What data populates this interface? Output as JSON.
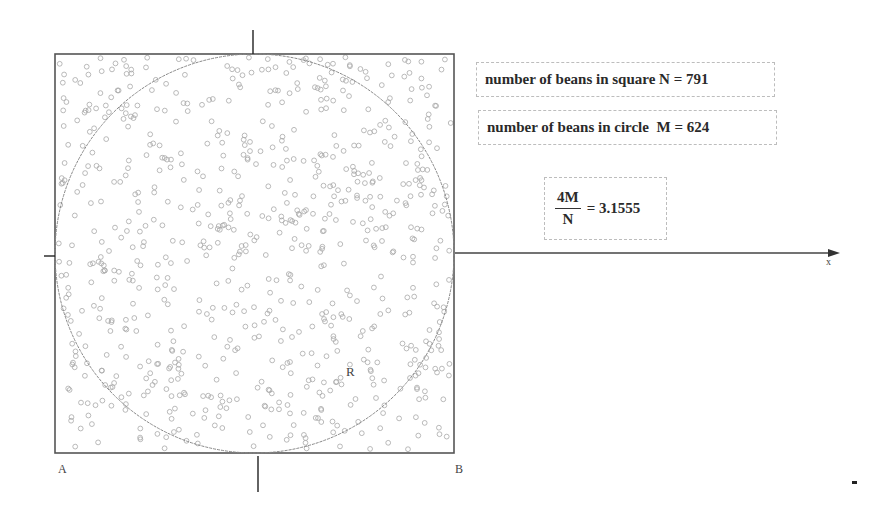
{
  "diagram": {
    "square": {
      "x": 55,
      "y": 54,
      "size": 399,
      "stroke": "#555555"
    },
    "circle": {
      "cx": 254.5,
      "cy": 253.5,
      "r": 199.5,
      "stroke": "#888888"
    },
    "axes": {
      "x_axis": {
        "from": [
          455,
          253
        ],
        "to": [
          840,
          253
        ],
        "label": "x"
      },
      "top_tick": {
        "x": 253,
        "y1": 30,
        "y2": 54
      },
      "bottom_tick": {
        "x": 258,
        "y1": 456,
        "y2": 492
      },
      "left_tick": {
        "x1": 44,
        "x2": 55,
        "y": 256
      }
    },
    "points": {
      "A": "A",
      "B": "B",
      "R": "R"
    },
    "bean_color": "#a8a8a8",
    "bean_radius": 2.4
  },
  "stats": {
    "square_label": "number of beans in square",
    "square_var": "N",
    "square_value": "791",
    "circle_label": "number of beans in circle",
    "circle_var": "M",
    "circle_value": "624",
    "ratio_numerator": "4M",
    "ratio_denominator": "N",
    "ratio_value": "3.1555"
  }
}
